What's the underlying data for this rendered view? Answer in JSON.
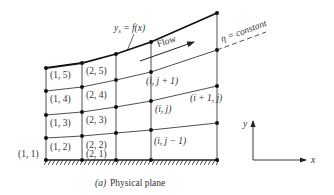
{
  "figure": {
    "caption_prefix": "(a)",
    "caption_text": "Physical plane",
    "colors": {
      "ink": "#222222",
      "text": "#333333",
      "background": "#ffffff"
    }
  },
  "labels": {
    "boundary_function": "y_s = f(x)",
    "boundary_y": "y",
    "boundary_sub": "s",
    "boundary_rest": " = f(x)",
    "eta_line": "η = constant",
    "flow": "Flow",
    "axis_x": "x",
    "axis_y": "y"
  },
  "grid": {
    "columns_x": [
      46,
      82,
      116,
      151,
      217
    ],
    "wall_y": 160,
    "nodes": [
      [
        68,
        91,
        115,
        138,
        160
      ],
      [
        63,
        87,
        112,
        136,
        160
      ],
      [
        54,
        80,
        107,
        133,
        160
      ],
      [
        42,
        72,
        101,
        130,
        160
      ],
      [
        13,
        50,
        86,
        123,
        160
      ]
    ]
  },
  "cell_labels": [
    {
      "text": "(1, 5)",
      "x": 50,
      "y": 78
    },
    {
      "text": "(2, 5)",
      "x": 86,
      "y": 74
    },
    {
      "text": "(1, 4)",
      "x": 50,
      "y": 102
    },
    {
      "text": "(2, 4)",
      "x": 86,
      "y": 98
    },
    {
      "text": "(1, 3)",
      "x": 50,
      "y": 126
    },
    {
      "text": "(2, 3)",
      "x": 86,
      "y": 123
    },
    {
      "text": "(1, 2)",
      "x": 50,
      "y": 150
    },
    {
      "text": "(2, 2)",
      "x": 86,
      "y": 148
    },
    {
      "text": "(2, 1)",
      "x": 86,
      "y": 157
    },
    {
      "text": "(1, 1)",
      "x": 18,
      "y": 157
    },
    {
      "text": "(i, j + 1)",
      "x": 146,
      "y": 84,
      "italic": true
    },
    {
      "text": "(i, j)",
      "x": 155,
      "y": 112,
      "italic": true
    },
    {
      "text": "(i + 1, j)",
      "x": 190,
      "y": 101,
      "italic": true
    },
    {
      "text": "(i, j − 1)",
      "x": 154,
      "y": 144,
      "italic": true
    }
  ]
}
